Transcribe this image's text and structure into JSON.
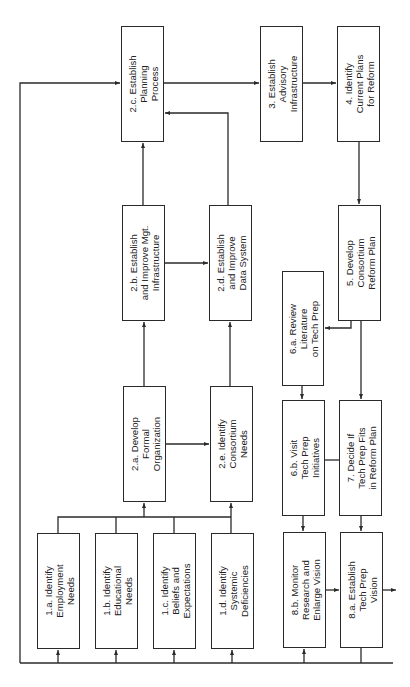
{
  "diagram": {
    "orientation": "rotated-90-ccw",
    "line_color": "#2a2a2a",
    "nodes": [
      {
        "id": "2c",
        "label": "2.c. Establish\nPlanning\nProcess",
        "x": 121,
        "y": 26,
        "w": 43,
        "h": 116
      },
      {
        "id": "3",
        "label": "3. Establish\nAdvisory\nInfrastructure",
        "x": 260,
        "y": 26,
        "w": 43,
        "h": 116
      },
      {
        "id": "4",
        "label": "4. Identify\nCurrent Plans\nfor Reform",
        "x": 337,
        "y": 26,
        "w": 43,
        "h": 116
      },
      {
        "id": "2b",
        "label": "2.b. Establish\nand Improve Mgt.\nInfrastructure",
        "x": 122,
        "y": 205,
        "w": 43,
        "h": 116
      },
      {
        "id": "2d",
        "label": "2.d. Establish\nand Improve\nData System",
        "x": 209,
        "y": 205,
        "w": 43,
        "h": 116
      },
      {
        "id": "5",
        "label": "5. Develop\nConsortium\nReform Plan",
        "x": 338,
        "y": 205,
        "w": 43,
        "h": 116
      },
      {
        "id": "6a",
        "label": "6.a. Review\nLiterature\non Tech Prep",
        "x": 282,
        "y": 271,
        "w": 42,
        "h": 115
      },
      {
        "id": "2a",
        "label": "2.a. Develop\nFormal\nOrganization",
        "x": 123,
        "y": 386,
        "w": 43,
        "h": 116
      },
      {
        "id": "2e",
        "label": "2.e. Identify\nConsortium\nNeeds",
        "x": 210,
        "y": 386,
        "w": 43,
        "h": 116
      },
      {
        "id": "6b",
        "label": "6.b. Visit\nTech Prep\nInitiatives",
        "x": 282,
        "y": 400,
        "w": 43,
        "h": 116
      },
      {
        "id": "7",
        "label": "7. Decide If\nTech Prep Fits\nin Reform Plan",
        "x": 339,
        "y": 400,
        "w": 43,
        "h": 116
      },
      {
        "id": "1a",
        "label": "1.a. Identify\nEmployment\nNeeds",
        "x": 37,
        "y": 533,
        "w": 43,
        "h": 116
      },
      {
        "id": "1b",
        "label": "1.b. Identify\nEducational\nNeeds",
        "x": 95,
        "y": 533,
        "w": 43,
        "h": 116
      },
      {
        "id": "1c",
        "label": "1.c. Identify\nBeliefs and\nExpectations",
        "x": 153,
        "y": 533,
        "w": 43,
        "h": 116
      },
      {
        "id": "1d",
        "label": "1.d. Identify\nSystemic\nDeficiencies",
        "x": 211,
        "y": 533,
        "w": 43,
        "h": 116
      },
      {
        "id": "8b",
        "label": "8.b. Monitor\nResearch and\nEnlarge Vision",
        "x": 283,
        "y": 532,
        "w": 43,
        "h": 116
      },
      {
        "id": "8a",
        "label": "8.a. Establish\nTech Prep\nVision",
        "x": 340,
        "y": 532,
        "w": 43,
        "h": 116
      }
    ],
    "edges": [
      {
        "from": "1a",
        "to": "2a"
      },
      {
        "from": "1b",
        "to": "2a"
      },
      {
        "from": "1c",
        "to": "2e"
      },
      {
        "from": "1d",
        "to": "2e"
      },
      {
        "from": "2a",
        "to": "2b"
      },
      {
        "from": "2a",
        "to": "2e"
      },
      {
        "from": "2e",
        "to": "2d"
      },
      {
        "from": "2b",
        "to": "2c"
      },
      {
        "from": "2b",
        "to": "2d"
      },
      {
        "from": "2d",
        "to": "2c"
      },
      {
        "from": "2c",
        "to": "3"
      },
      {
        "from": "3",
        "to": "4"
      },
      {
        "from": "4",
        "to": "5"
      },
      {
        "from": "5",
        "to": "6a"
      },
      {
        "from": "5",
        "to": "7"
      },
      {
        "from": "6a",
        "to": "6b"
      },
      {
        "from": "6b",
        "to": "7"
      },
      {
        "from": "6b",
        "to": "8b"
      },
      {
        "from": "7",
        "to": "8a"
      },
      {
        "from": "8b",
        "to": "8a"
      },
      {
        "from": "feedback-loop",
        "to": "2c"
      },
      {
        "from": "feedback-loop",
        "to": "1a"
      },
      {
        "from": "feedback-loop",
        "to": "1b"
      },
      {
        "from": "feedback-loop",
        "to": "1c"
      },
      {
        "from": "feedback-loop",
        "to": "1d"
      },
      {
        "from": "feedback-loop",
        "to": "8b"
      },
      {
        "from": "8a",
        "to": "feedback-loop"
      },
      {
        "from": "8a",
        "to": "output"
      }
    ]
  }
}
